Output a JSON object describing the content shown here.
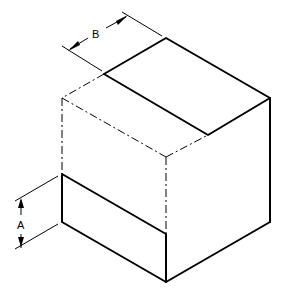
{
  "diagram": {
    "type": "isometric-cube-dimension-drawing",
    "dimensions": [
      {
        "id": "A",
        "label": "A",
        "orientation": "vertical"
      },
      {
        "id": "B",
        "label": "B",
        "orientation": "isometric"
      }
    ],
    "line_color": "#000000",
    "background": "#ffffff"
  }
}
